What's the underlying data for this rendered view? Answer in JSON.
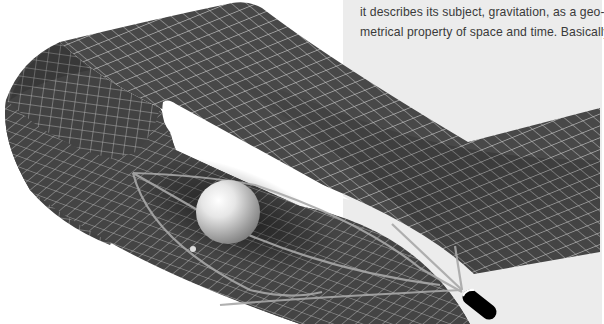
{
  "page": {
    "body_text_lines": [
      "it describes its subject, gravitation, as a geo-",
      "metrical property of space and time. Basically"
    ]
  },
  "illustration": {
    "subject": "curved spacetime sheet folded back on itself with a massive sphere creating a gravity well and light paths bending around it",
    "elements": [
      "spacetime-grid-sheet",
      "massive-sphere",
      "small-orbiting-body",
      "light-rays",
      "black-capsule-observer"
    ],
    "colors": {
      "sheet": "#4a4a4a",
      "grid": "#b9b9b9",
      "panel": "#ececec",
      "background": "#ffffff",
      "text": "#3a3a3a"
    }
  }
}
